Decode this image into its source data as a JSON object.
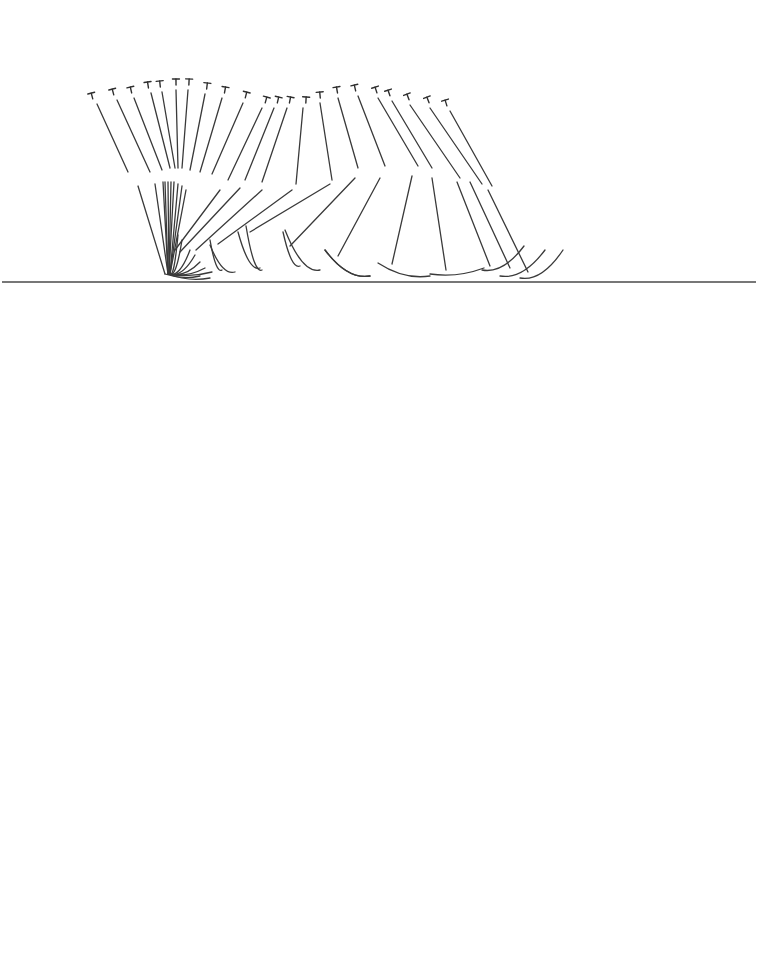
{
  "figure": {
    "ground": {
      "x1": 2,
      "x2": 756,
      "y": 282,
      "color": "#4a4a4a"
    },
    "stroke_color": "#3a3a3a",
    "pivot": {
      "x": 168,
      "y": 276
    },
    "frames": [
      {
        "head": [
          92,
          96
        ],
        "trunk": [
          [
            97,
            104
          ],
          [
            128,
            172
          ]
        ],
        "thigh": [
          [
            138,
            186
          ],
          [
            165,
            274
          ]
        ],
        "shank": [
          [
            165,
            274
          ],
          [
            200,
            276
          ]
        ]
      },
      {
        "head": [
          113,
          92
        ],
        "trunk": [
          [
            117,
            100
          ],
          [
            150,
            172
          ]
        ],
        "thigh": [
          [
            155,
            184
          ],
          [
            168,
            274
          ]
        ],
        "shank": [
          [
            168,
            274
          ],
          [
            210,
            278
          ]
        ]
      },
      {
        "head": [
          131,
          90
        ],
        "trunk": [
          [
            134,
            98
          ],
          [
            162,
            170
          ]
        ],
        "thigh": [
          [
            163,
            182
          ],
          [
            168,
            274
          ]
        ],
        "shank": [
          [
            168,
            274
          ],
          [
            212,
            272
          ]
        ]
      },
      {
        "head": [
          148,
          85
        ],
        "trunk": [
          [
            151,
            93
          ],
          [
            170,
            168
          ]
        ],
        "thigh": [
          [
            165,
            182
          ],
          [
            168,
            274
          ]
        ],
        "shank": [
          [
            168,
            274
          ],
          [
            205,
            268
          ]
        ]
      },
      {
        "head": [
          160,
          84
        ],
        "trunk": [
          [
            162,
            92
          ],
          [
            175,
            168
          ]
        ],
        "thigh": [
          [
            168,
            182
          ],
          [
            169,
            274
          ]
        ],
        "shank": [
          [
            169,
            274
          ],
          [
            200,
            262
          ]
        ]
      },
      {
        "head": [
          176,
          82
        ],
        "trunk": [
          [
            176,
            90
          ],
          [
            178,
            168
          ]
        ],
        "thigh": [
          [
            171,
            182
          ],
          [
            169,
            274
          ]
        ],
        "shank": [
          [
            169,
            274
          ],
          [
            195,
            255
          ]
        ]
      },
      {
        "head": [
          189,
          82
        ],
        "trunk": [
          [
            188,
            90
          ],
          [
            182,
            168
          ]
        ],
        "thigh": [
          [
            174,
            182
          ],
          [
            169,
            274
          ]
        ],
        "shank": [
          [
            169,
            274
          ],
          [
            190,
            250
          ]
        ]
      },
      {
        "head": [
          207,
          86
        ],
        "trunk": [
          [
            205,
            94
          ],
          [
            190,
            170
          ]
        ],
        "thigh": [
          [
            178,
            184
          ],
          [
            170,
            274
          ]
        ],
        "shank": [
          [
            170,
            274
          ],
          [
            182,
            240
          ]
        ]
      },
      {
        "head": [
          225,
          90
        ],
        "trunk": [
          [
            222,
            98
          ],
          [
            200,
            172
          ]
        ],
        "thigh": [
          [
            182,
            186
          ],
          [
            170,
            274
          ]
        ],
        "shank": [
          [
            170,
            274
          ],
          [
            178,
            235
          ]
        ]
      },
      {
        "head": [
          246,
          95
        ],
        "trunk": [
          [
            243,
            103
          ],
          [
            212,
            174
          ]
        ],
        "thigh": [
          [
            186,
            190
          ],
          [
            170,
            274
          ]
        ],
        "shank": [
          [
            210,
            240
          ],
          [
            222,
            270
          ]
        ]
      },
      {
        "head": [
          266,
          100
        ],
        "trunk": [
          [
            262,
            108
          ],
          [
            228,
            180
          ]
        ],
        "thigh": [
          [
            220,
            190
          ],
          [
            175,
            250
          ]
        ],
        "shank": [
          [
            210,
            245
          ],
          [
            235,
            272
          ]
        ]
      },
      {
        "head": [
          278,
          100
        ],
        "trunk": [
          [
            274,
            108
          ],
          [
            245,
            180
          ]
        ],
        "thigh": [
          [
            240,
            188
          ],
          [
            180,
            252
          ]
        ],
        "shank": [
          [
            238,
            232
          ],
          [
            260,
            268
          ]
        ]
      },
      {
        "head": [
          290,
          100
        ],
        "trunk": [
          [
            287,
            108
          ],
          [
            262,
            182
          ]
        ],
        "thigh": [
          [
            262,
            190
          ],
          [
            196,
            250
          ]
        ],
        "shank": [
          [
            246,
            226
          ],
          [
            262,
            270
          ]
        ]
      },
      {
        "head": [
          306,
          100
        ],
        "trunk": [
          [
            303,
            108
          ],
          [
            296,
            184
          ]
        ],
        "thigh": [
          [
            292,
            190
          ],
          [
            218,
            244
          ]
        ],
        "shank": [
          [
            283,
            232
          ],
          [
            300,
            266
          ]
        ]
      },
      {
        "head": [
          320,
          95
        ],
        "trunk": [
          [
            320,
            103
          ],
          [
            332,
            180
          ]
        ],
        "thigh": [
          [
            330,
            184
          ],
          [
            250,
            232
          ]
        ],
        "shank": [
          [
            285,
            230
          ],
          [
            320,
            270
          ]
        ]
      },
      {
        "head": [
          337,
          90
        ],
        "trunk": [
          [
            338,
            98
          ],
          [
            358,
            168
          ]
        ],
        "thigh": [
          [
            355,
            178
          ],
          [
            290,
            246
          ]
        ],
        "shank": [
          [
            325,
            250
          ],
          [
            370,
            276
          ]
        ]
      },
      {
        "head": [
          355,
          88
        ],
        "trunk": [
          [
            358,
            96
          ],
          [
            385,
            166
          ]
        ],
        "thigh": [
          [
            380,
            178
          ],
          [
            338,
            256
          ]
        ],
        "shank": [
          [
            325,
            250
          ],
          [
            370,
            276
          ]
        ]
      },
      {
        "head": [
          376,
          90
        ],
        "trunk": [
          [
            378,
            98
          ],
          [
            418,
            166
          ]
        ],
        "thigh": [
          [
            412,
            176
          ],
          [
            392,
            264
          ]
        ],
        "shank": [
          [
            378,
            263
          ],
          [
            430,
            276
          ]
        ]
      },
      {
        "head": [
          389,
          93
        ],
        "trunk": [
          [
            392,
            101
          ],
          [
            432,
            168
          ]
        ],
        "thigh": [
          [
            432,
            178
          ],
          [
            446,
            270
          ]
        ],
        "shank": [
          [
            430,
            274
          ],
          [
            484,
            268
          ]
        ]
      },
      {
        "head": [
          408,
          97
        ],
        "trunk": [
          [
            410,
            105
          ],
          [
            460,
            178
          ]
        ],
        "thigh": [
          [
            457,
            182
          ],
          [
            490,
            266
          ]
        ],
        "shank": [
          [
            482,
            270
          ],
          [
            524,
            246
          ]
        ]
      },
      {
        "head": [
          428,
          100
        ],
        "trunk": [
          [
            430,
            108
          ],
          [
            482,
            184
          ]
        ],
        "thigh": [
          [
            470,
            182
          ],
          [
            510,
            268
          ]
        ],
        "shank": [
          [
            500,
            276
          ],
          [
            545,
            250
          ]
        ]
      },
      {
        "head": [
          446,
          103
        ],
        "trunk": [
          [
            450,
            111
          ],
          [
            492,
            186
          ]
        ],
        "thigh": [
          [
            488,
            190
          ],
          [
            528,
            272
          ]
        ],
        "shank": [
          [
            520,
            278
          ],
          [
            563,
            250
          ]
        ]
      }
    ]
  }
}
